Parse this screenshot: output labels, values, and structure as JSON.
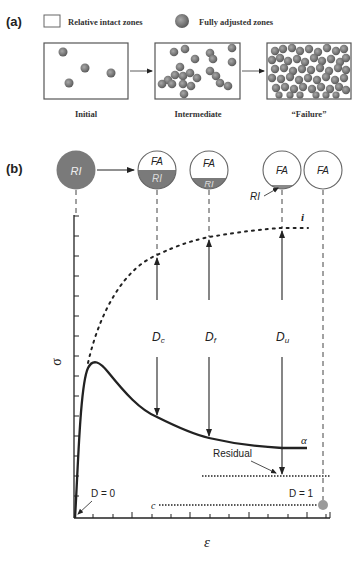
{
  "panel_a": {
    "label": "(a)",
    "legend": {
      "intact_label": "Relative intact zones",
      "adjusted_label": "Fully adjusted zones"
    },
    "stages": [
      {
        "label": "Initial",
        "particles": 4
      },
      {
        "label": "Intermediate",
        "particles": 22
      },
      {
        "label": "“Failure”",
        "particles": 70
      }
    ]
  },
  "panel_b": {
    "label": "(b)",
    "circles": [
      {
        "top": "",
        "bottom": "RI",
        "state": "intact"
      },
      {
        "top": "FA",
        "bottom": "RI",
        "state": "half"
      },
      {
        "top": "FA",
        "bottom": "RI",
        "state": "third"
      },
      {
        "top": "FA",
        "bottom": "",
        "state": "sliver",
        "callout": "RI"
      },
      {
        "top": "FA",
        "bottom": "",
        "state": "full"
      }
    ],
    "damage_labels": [
      {
        "main": "D",
        "sub": "c"
      },
      {
        "main": "D",
        "sub": "f"
      },
      {
        "main": "D",
        "sub": "u"
      }
    ],
    "curve_labels": {
      "intact": "i",
      "actual": "α",
      "residual": "Residual",
      "critical": "c"
    },
    "d_start": "D = 0",
    "d_end": "D = 1",
    "y_axis": "σ",
    "x_axis": "ε",
    "colors": {
      "dark_fill": "#7a7a7a",
      "stroke": "#222222",
      "sliver": "#8a8a8a",
      "dot": "#9a9a9a"
    }
  }
}
